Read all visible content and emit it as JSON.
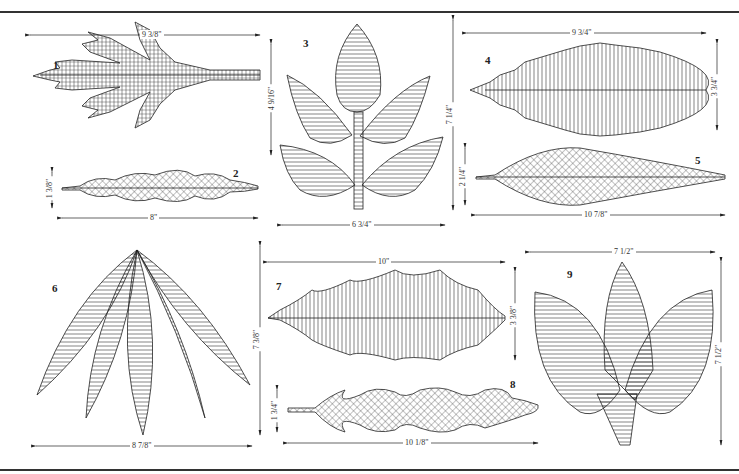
{
  "sheet": {
    "title": "Leaf pattern templates",
    "figures": [
      {
        "id": "1",
        "label": "1",
        "width": "9 3/8\"",
        "height": "4 9/16\"",
        "fill": "grid-hatch"
      },
      {
        "id": "2",
        "label": "2",
        "width": "8\"",
        "height": "1 3/8\"",
        "fill": "crosshatch"
      },
      {
        "id": "3",
        "label": "3",
        "width": "6 3/4\"",
        "height": "7 1/4\"",
        "fill": "horizontal-hatch"
      },
      {
        "id": "4",
        "label": "4",
        "width": "9 3/4\"",
        "height": "3 3/4\"",
        "fill": "vertical-hatch"
      },
      {
        "id": "5",
        "label": "5",
        "width": "10 7/8\"",
        "height": "2 1/4\"",
        "fill": "crosshatch"
      },
      {
        "id": "6",
        "label": "6",
        "width": "8 7/8\"",
        "height": "7 3/8\"",
        "fill": "horizontal-hatch"
      },
      {
        "id": "7",
        "label": "7",
        "width": "10\"",
        "height": "3 3/8\"",
        "fill": "vertical-hatch"
      },
      {
        "id": "8",
        "label": "8",
        "width": "10 1/8\"",
        "height": "1 3/4\"",
        "fill": "crosshatch"
      },
      {
        "id": "9",
        "label": "9",
        "width": "7 1/2\"",
        "height": "7 1/2\"",
        "fill": "horizontal-hatch"
      }
    ]
  },
  "colors": {
    "ink": "#222222",
    "paper": "#ffffff",
    "rule": "#333333"
  }
}
